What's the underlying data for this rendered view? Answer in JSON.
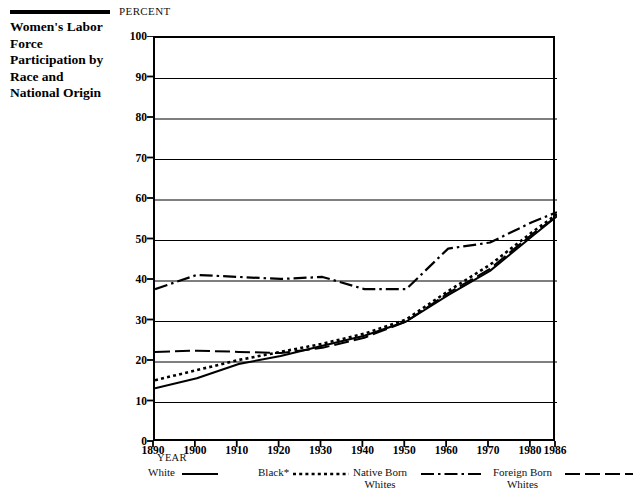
{
  "caption": {
    "title": "Women's Labor Force Participation by Race and National Origin"
  },
  "chart_data": {
    "type": "line",
    "title": "Women's Labor Force Participation by Race and National Origin",
    "unit_label": "PERCENT",
    "xlabel": "YEAR",
    "ylabel": "PERCENT",
    "xlim": [
      1890,
      1986
    ],
    "ylim": [
      0,
      100
    ],
    "grid": true,
    "legend_position": "bottom",
    "x": [
      1890,
      1900,
      1910,
      1920,
      1930,
      1940,
      1950,
      1960,
      1970,
      1980,
      1986
    ],
    "xticks": [
      "1890",
      "1900",
      "1910",
      "1920",
      "1930",
      "1940",
      "1950",
      "1960",
      "1970",
      "1980",
      "1986"
    ],
    "yticks": [
      "0",
      "10",
      "20",
      "30",
      "40",
      "50",
      "60",
      "70",
      "80",
      "90",
      "100"
    ],
    "series": [
      {
        "name": "White",
        "style": "solid",
        "values": [
          13.5,
          16.0,
          19.5,
          21.5,
          24.0,
          26.5,
          30.0,
          36.5,
          42.5,
          51.0,
          56.0
        ]
      },
      {
        "name": "Black*",
        "style": "dotted",
        "values": [
          15.5,
          18.0,
          20.5,
          22.5,
          24.5,
          27.0,
          30.5,
          37.5,
          44.0,
          52.0,
          56.5
        ]
      },
      {
        "name": "Native Born Whites",
        "style": "long-dash",
        "values": [
          22.5,
          22.8,
          22.5,
          22.2,
          23.5,
          26.0,
          30.0,
          37.0,
          43.0,
          51.5,
          56.0
        ]
      },
      {
        "name": "Foreign Born Whites",
        "style": "dash-dot",
        "values": [
          38.0,
          41.5,
          41.0,
          40.5,
          41.0,
          38.0,
          38.0,
          48.0,
          49.5,
          54.5,
          57.0
        ]
      }
    ]
  },
  "legend": {
    "entries": [
      {
        "label": "White",
        "label_line2": "",
        "style": "solid"
      },
      {
        "label": "Black*",
        "label_line2": "",
        "style": "dotted"
      },
      {
        "label": "Native Born",
        "label_line2": "Whites",
        "style": "dash-dot"
      },
      {
        "label": "Foreign Born",
        "label_line2": "Whites",
        "style": "long-dash"
      }
    ]
  },
  "colors": {
    "ink": "#000000",
    "paper": "#ffffff"
  }
}
